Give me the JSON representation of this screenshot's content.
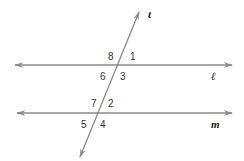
{
  "diagram": {
    "colors": {
      "line": "#8a8a8a",
      "text": "#222222",
      "background": "#ffffff"
    },
    "lines": {
      "l": {
        "label": "ℓ",
        "y": 65,
        "x1": 15,
        "x2": 232
      },
      "m": {
        "label": "m",
        "y": 113,
        "x1": 17,
        "x2": 232
      },
      "t": {
        "label": "t",
        "x1": 139,
        "y1": 12,
        "x2": 80,
        "y2": 157
      }
    },
    "angles": {
      "a8": "8",
      "a1": "1",
      "a6": "6",
      "a3": "3",
      "a7": "7",
      "a2": "2",
      "a5": "5",
      "a4": "4"
    }
  }
}
